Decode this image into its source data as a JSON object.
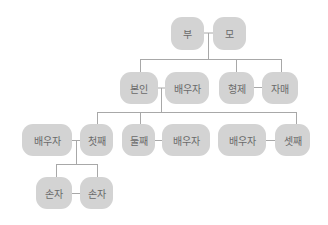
{
  "diagram": {
    "type": "family-tree",
    "node_color": "#d3d3d3",
    "line_color": "#a8a8a8",
    "text_color": "#6a6a6a",
    "nodes": {
      "father": "부",
      "mother": "모",
      "self": "본인",
      "self_spouse": "배우자",
      "brother": "형제",
      "sister": "자매",
      "first_spouse": "배우자",
      "first_child": "첫째",
      "second_child": "둘째",
      "second_spouse": "배우자",
      "third_spouse": "배우자",
      "third_child": "셋째",
      "grandchild_1": "손자",
      "grandchild_2": "손자"
    }
  }
}
